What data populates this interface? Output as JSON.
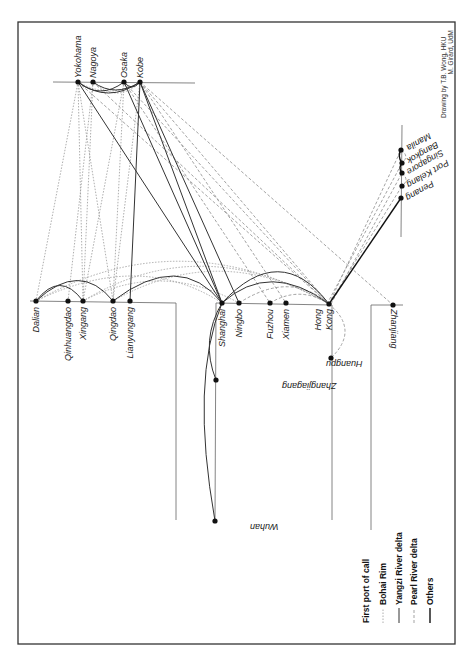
{
  "credit": {
    "line1": "Drawing by T.B. Wong, HKU",
    "line2": "M. Girard, UdM"
  },
  "regions": {
    "japan": {
      "ports": [
        {
          "name": "Yokohama",
          "x": 78,
          "y": 82
        },
        {
          "name": "Nagoya",
          "x": 93,
          "y": 82
        },
        {
          "name": "Osaka",
          "x": 124,
          "y": 82
        },
        {
          "name": "Kobe",
          "x": 140,
          "y": 82
        }
      ]
    },
    "bohai_rim": {
      "ports": [
        {
          "name": "Dalian",
          "x": 36,
          "y": 301
        },
        {
          "name": "Qinhuangdao",
          "x": 68,
          "y": 301
        },
        {
          "name": "Xingang",
          "x": 83,
          "y": 301
        },
        {
          "name": "Qingdao",
          "x": 113,
          "y": 301
        },
        {
          "name": "Lianyungang",
          "x": 130,
          "y": 301
        }
      ]
    },
    "yangzi_river_delta": {
      "ports": [
        {
          "name": "Shanghai",
          "x": 222,
          "y": 303
        },
        {
          "name": "Ningbo",
          "x": 239,
          "y": 303
        },
        {
          "name": "Fuzhou",
          "x": 270,
          "y": 303
        },
        {
          "name": "Xiamen",
          "x": 286,
          "y": 303
        },
        {
          "name": "Zhangjiagang",
          "x": 216,
          "y": 380
        },
        {
          "name": "Wuhan",
          "x": 215,
          "y": 521
        }
      ]
    },
    "pearl_river_delta": {
      "ports": [
        {
          "name": "Hong Kong",
          "x": 329,
          "y": 304
        },
        {
          "name": "Huangpu",
          "x": 331,
          "y": 358
        },
        {
          "name": "Zhanjiang",
          "x": 393,
          "y": 305
        }
      ]
    },
    "southeast_asia": {
      "ports": [
        {
          "name": "Manila",
          "x": 401,
          "y": 150
        },
        {
          "name": "Bangkok",
          "x": 402,
          "y": 163
        },
        {
          "name": "Singapore",
          "x": 402,
          "y": 173
        },
        {
          "name": "Port Kelang",
          "x": 402,
          "y": 186
        },
        {
          "name": "Penang",
          "x": 401,
          "y": 198
        }
      ]
    }
  },
  "labels": {
    "yokohama": "Yokohama",
    "nagoya": "Nagoya",
    "osaka": "Osaka",
    "kobe": "Kobe",
    "dalian": "Dalian",
    "qinhuangdao": "Qinhuangdao",
    "xingang": "Xingang",
    "qingdao": "Qingdao",
    "lianyungang": "Lianyungang",
    "shanghai": "Shanghai",
    "ningbo": "Ningbo",
    "fuzhou": "Fuzhou",
    "xiamen": "Xiamen",
    "hong": "Hong",
    "kong": "Kong",
    "huangpu": "Huangpu",
    "zhanjiang": "Zhanjiang",
    "zhangjiagang": "Zhangjiagang",
    "wuhan": "Wuhan",
    "manila": "Manila",
    "bangkok": "Bangkok",
    "singapore": "Singapore",
    "port_kelang": "Port Kelang",
    "penang": "Penang"
  },
  "legend": {
    "title": "First port of call",
    "items": [
      {
        "label": "Bohai Rim",
        "style": "dotted-light"
      },
      {
        "label": "Yangzi River delta",
        "style": "solid-thin"
      },
      {
        "label": "Pearl River delta",
        "style": "dashed-light"
      },
      {
        "label": "Others",
        "style": "solid-bold"
      }
    ]
  },
  "colors": {
    "frame": "#333333",
    "bohai": "#999999",
    "yangzi": "#333333",
    "pearl": "#999999",
    "others": "#111111"
  }
}
